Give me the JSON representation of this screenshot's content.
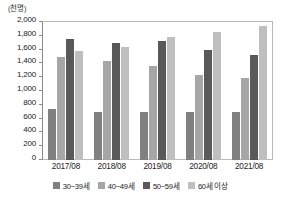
{
  "chart_data": {
    "type": "bar",
    "title": "",
    "subtitle": "",
    "unit_label": "(천명)",
    "xlabel": "",
    "ylabel": "",
    "categories": [
      "2017/08",
      "2018/08",
      "2019/08",
      "2020/08",
      "2021/08"
    ],
    "series": [
      {
        "name": "30~39세",
        "color": "#808080",
        "values": [
          740,
          700,
          700,
          700,
          690
        ]
      },
      {
        "name": "40~49세",
        "color": "#a6a6a6",
        "values": [
          1490,
          1430,
          1360,
          1230,
          1190
        ]
      },
      {
        "name": "50~59세",
        "color": "#595959",
        "values": [
          1755,
          1690,
          1730,
          1600,
          1520
        ]
      },
      {
        "name": "60세 이상",
        "color": "#bfbfbf",
        "values": [
          1580,
          1645,
          1790,
          1855,
          1945
        ]
      }
    ],
    "ylim": [
      0,
      2000
    ],
    "ytick_values": [
      0,
      200,
      400,
      600,
      800,
      1000,
      1200,
      1400,
      1600,
      1800,
      2000
    ],
    "ytick_labels": [
      "0",
      "200",
      "400",
      "600",
      "800",
      "1,000",
      "1,200",
      "1,400",
      "1,600",
      "1,800",
      "2,000"
    ],
    "grid": false,
    "legend_position": "bottom",
    "plot_border_color": "#b9b9b9",
    "axis_color": "#8a8a8a"
  }
}
